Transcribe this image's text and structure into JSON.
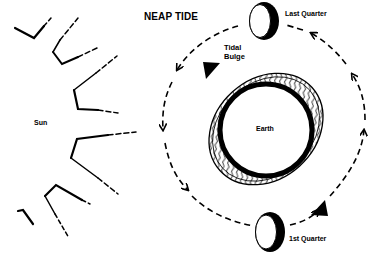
{
  "diagram": {
    "title": "NEAP TIDE",
    "labels": {
      "sun": "Sun",
      "earth": "Earth",
      "tidal_bulge": "Tidal\nBulge",
      "last_quarter": "Last Quarter",
      "first_quarter": "1st Quarter"
    },
    "elements": {
      "sun_rays": "sun-rays-icon",
      "orbit": "moon-orbit-path",
      "orbit_direction": "counterclockwise-arrows",
      "moon_last_quarter": "moon-last-quarter-icon",
      "moon_first_quarter": "moon-first-quarter-icon",
      "earth": "earth-circle",
      "tidal_bulge": "tidal-bulge-ellipse",
      "bulge_markers": "triangle-markers"
    },
    "colors": {
      "ink": "#000000",
      "background": "#ffffff"
    }
  }
}
